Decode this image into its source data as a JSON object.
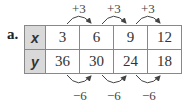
{
  "problem_label": "a.",
  "table": {
    "rows": [
      {
        "header": "x",
        "values": [
          "3",
          "6",
          "9",
          "12"
        ]
      },
      {
        "header": "y",
        "values": [
          "36",
          "30",
          "24",
          "18"
        ]
      }
    ]
  },
  "annotations": {
    "top": [
      "+3",
      "+3",
      "+3"
    ],
    "bottom": [
      "−6",
      "−6",
      "−6"
    ]
  }
}
